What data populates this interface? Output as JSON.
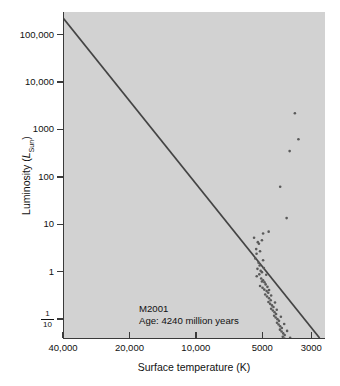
{
  "chart_data": {
    "type": "scatter",
    "title": "",
    "xlabel": "Surface temperature (K)",
    "ylabel": "Luminosity (L_Sun)",
    "ylabel_parts": {
      "prefix": "Luminosity (",
      "symbol": "L",
      "subscript": "Sun",
      "suffix": ")"
    },
    "x_scale": "log-reversed",
    "y_scale": "log",
    "xlim": [
      40000,
      2600
    ],
    "ylim": [
      0.04,
      300000
    ],
    "grid": false,
    "legend": null,
    "x_ticks": [
      {
        "value": 40000,
        "label": "40,000"
      },
      {
        "value": 20000,
        "label": "20,000"
      },
      {
        "value": 10000,
        "label": "10,000"
      },
      {
        "value": 5000,
        "label": "5000"
      },
      {
        "value": 3000,
        "label": "3000"
      }
    ],
    "y_ticks": [
      {
        "value": 100000,
        "label": "100,000"
      },
      {
        "value": 10000,
        "label": "10,000"
      },
      {
        "value": 1000,
        "label": "1000"
      },
      {
        "value": 100,
        "label": "100"
      },
      {
        "value": 10,
        "label": "10"
      },
      {
        "value": 1,
        "label": "1"
      },
      {
        "value": 0.1,
        "label": "1/10",
        "numerator": "1",
        "denominator": "10",
        "style": "fraction"
      }
    ],
    "annotations": [
      {
        "name": "cluster-name",
        "text": "M2001"
      },
      {
        "name": "cluster-age",
        "text": "Age: 4240 million years"
      }
    ],
    "series": [
      {
        "name": "zero-age-main-sequence-line",
        "type": "line",
        "color": "#444444",
        "points": [
          [
            41000,
            260000
          ],
          [
            2750,
            0.04
          ]
        ]
      },
      {
        "name": "cluster-stars",
        "type": "scatter",
        "color": "#5a5a5a",
        "marker": "circle",
        "marker_size_px": 2.6,
        "points": [
          [
            3560,
            2200
          ],
          [
            3430,
            620
          ],
          [
            3760,
            350
          ],
          [
            4150,
            62
          ],
          [
            3880,
            13.5
          ],
          [
            4680,
            7.0
          ],
          [
            4960,
            6.4
          ],
          [
            5020,
            4.6
          ],
          [
            5180,
            3.9
          ],
          [
            5240,
            4.2
          ],
          [
            5330,
            3.0
          ],
          [
            5310,
            2.4
          ],
          [
            5380,
            1.9
          ],
          [
            5200,
            1.55
          ],
          [
            5140,
            1.35
          ],
          [
            5260,
            1.15
          ],
          [
            5090,
            1.05
          ],
          [
            5020,
            0.98
          ],
          [
            5160,
            0.88
          ],
          [
            5300,
            0.8
          ],
          [
            5060,
            0.72
          ],
          [
            4960,
            0.66
          ],
          [
            4890,
            0.6
          ],
          [
            4830,
            0.54
          ],
          [
            5120,
            0.5
          ],
          [
            4990,
            0.46
          ],
          [
            4900,
            0.42
          ],
          [
            4780,
            0.39
          ],
          [
            4700,
            0.36
          ],
          [
            4850,
            0.33
          ],
          [
            4760,
            0.3
          ],
          [
            4660,
            0.275
          ],
          [
            4580,
            0.25
          ],
          [
            4690,
            0.23
          ],
          [
            4610,
            0.21
          ],
          [
            4520,
            0.195
          ],
          [
            4450,
            0.18
          ],
          [
            4560,
            0.165
          ],
          [
            4480,
            0.152
          ],
          [
            4400,
            0.14
          ],
          [
            4330,
            0.128
          ],
          [
            4420,
            0.118
          ],
          [
            4350,
            0.108
          ],
          [
            4270,
            0.1
          ],
          [
            4200,
            0.092
          ],
          [
            4290,
            0.084
          ],
          [
            4220,
            0.077
          ],
          [
            4150,
            0.071
          ],
          [
            4080,
            0.065
          ],
          [
            4160,
            0.06
          ],
          [
            4090,
            0.055
          ],
          [
            4020,
            0.05
          ],
          [
            3960,
            0.046
          ],
          [
            4040,
            0.0425
          ],
          [
            3970,
            0.039
          ],
          [
            3900,
            0.036
          ],
          [
            3840,
            0.033
          ],
          [
            3910,
            0.0305
          ],
          [
            3845,
            0.028
          ],
          [
            3780,
            0.0258
          ],
          [
            3720,
            0.0238
          ],
          [
            3790,
            0.022
          ],
          [
            3725,
            0.0203
          ],
          [
            3660,
            0.0187
          ],
          [
            3605,
            0.0172
          ],
          [
            3670,
            0.0159
          ],
          [
            3610,
            0.0147
          ],
          [
            3550,
            0.0136
          ],
          [
            3495,
            0.0126
          ],
          [
            3555,
            0.0116
          ],
          [
            3500,
            0.0107
          ],
          [
            3445,
            0.0099
          ],
          [
            5450,
            5.2
          ],
          [
            5120,
            2.7
          ],
          [
            4960,
            1.75
          ],
          [
            4920,
            1.2
          ],
          [
            4800,
            0.86
          ],
          [
            5020,
            0.62
          ],
          [
            4740,
            0.48
          ],
          [
            4660,
            0.41
          ],
          [
            4560,
            0.315
          ],
          [
            4380,
            0.225
          ],
          [
            4300,
            0.158
          ],
          [
            4120,
            0.112
          ],
          [
            3980,
            0.079
          ],
          [
            3860,
            0.0565
          ],
          [
            3740,
            0.0405
          ],
          [
            3630,
            0.0293
          ],
          [
            3520,
            0.0213
          ],
          [
            3420,
            0.0155
          ],
          [
            3380,
            0.0128
          ],
          [
            3340,
            0.0105
          ]
        ]
      }
    ]
  }
}
